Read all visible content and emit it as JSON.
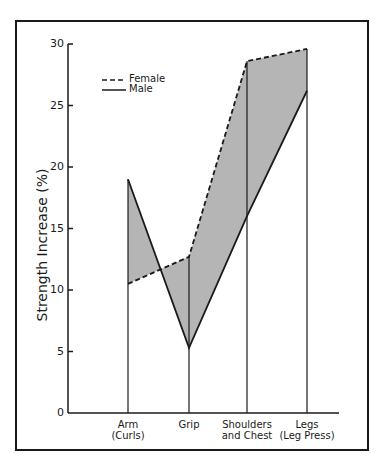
{
  "chart_data": {
    "type": "line",
    "title": "",
    "xlabel": "",
    "ylabel": "Strength Increase (%)",
    "ylim": [
      0,
      30
    ],
    "yticks": [
      0,
      5,
      10,
      15,
      20,
      25,
      30
    ],
    "categories": [
      "Arm (Curls)",
      "Grip",
      "Shoulders and Chest",
      "Legs (Leg Press)"
    ],
    "category_lines": [
      [
        "Arm",
        "(Curls)"
      ],
      [
        "Grip",
        ""
      ],
      [
        "Shoulders",
        "and Chest"
      ],
      [
        "Legs",
        "(Leg Press)"
      ]
    ],
    "series": [
      {
        "name": "Female",
        "style": "dashed",
        "values": [
          10.5,
          12.7,
          28.6,
          29.6
        ]
      },
      {
        "name": "Male",
        "style": "solid",
        "values": [
          19.0,
          5.3,
          16.0,
          26.2
        ]
      }
    ],
    "shaded_between_series": true,
    "fill_color": "#b5b5b5",
    "line_color": "#1a1a1a",
    "grid": false,
    "legend_position": "upper-left"
  },
  "legend": {
    "female": "Female",
    "male": "Male"
  },
  "axis": {
    "ylabel": "Strength Increase (%)",
    "ticks": [
      "0",
      "5",
      "10",
      "15",
      "20",
      "25",
      "30"
    ]
  },
  "categories": {
    "arm_line1": "Arm",
    "arm_line2": "(Curls)",
    "grip_line1": "Grip",
    "shoulders_line1": "Shoulders",
    "shoulders_line2": "and Chest",
    "legs_line1": "Legs",
    "legs_line2": "(Leg Press)"
  }
}
